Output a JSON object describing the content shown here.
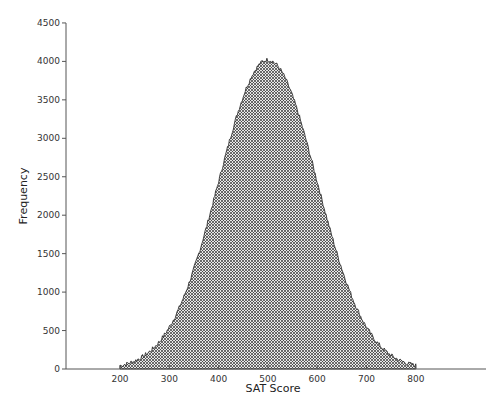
{
  "chart_data": {
    "type": "area",
    "title": "",
    "xlabel": "SAT Score",
    "ylabel": "Frequency",
    "xlim": [
      90,
      900
    ],
    "ylim": [
      0,
      4500
    ],
    "x_ticks": [
      200,
      300,
      400,
      500,
      600,
      700,
      800
    ],
    "y_ticks": [
      0,
      500,
      1000,
      1500,
      2000,
      2500,
      3000,
      3500,
      4000,
      4500
    ],
    "grid": false,
    "legend": null,
    "fill": "crosshatch",
    "distribution": {
      "shape": "normal",
      "mean": 500,
      "sd": 100,
      "peak": 4020,
      "min_x": 200,
      "max_x": 800
    },
    "x": [
      200,
      225,
      250,
      275,
      300,
      325,
      350,
      375,
      400,
      425,
      450,
      475,
      500,
      525,
      550,
      575,
      600,
      625,
      650,
      675,
      700,
      725,
      750,
      775,
      800
    ],
    "values": [
      90,
      130,
      180,
      310,
      470,
      690,
      1000,
      1390,
      1850,
      2370,
      2910,
      3400,
      4000,
      3800,
      3510,
      3050,
      2480,
      1950,
      1400,
      990,
      650,
      410,
      250,
      140,
      90
    ]
  }
}
